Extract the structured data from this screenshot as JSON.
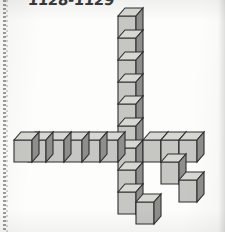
{
  "page": {
    "label": "1128-1129",
    "background_color": "#fdfdfc",
    "has_perforation_edge": true
  },
  "figure": {
    "name": "isometric-cube-structure",
    "projection": "isometric",
    "cube_size_px": 22,
    "colors": {
      "top_face": "#d7d7d2",
      "front_face": "#c6c6c2",
      "side_face": "#8e8e8a",
      "outline": "#2f2f2f"
    },
    "counts": {
      "vertical_column": 11,
      "left_arm": 6,
      "right_arm": 3,
      "staircase": 3,
      "total_visible": 23
    },
    "parts": [
      {
        "name": "vertical-column",
        "cubes": 11,
        "orientation": "vertical"
      },
      {
        "name": "left-horizontal-arm",
        "cubes": 6,
        "orientation": "horizontal-left"
      },
      {
        "name": "right-horizontal-arm",
        "cubes": 3,
        "orientation": "horizontal-right"
      },
      {
        "name": "descending-staircase",
        "cubes": 3,
        "orientation": "diagonal-down-right"
      },
      {
        "name": "bottom-detached-cube",
        "cubes": 1,
        "orientation": "single"
      }
    ]
  }
}
